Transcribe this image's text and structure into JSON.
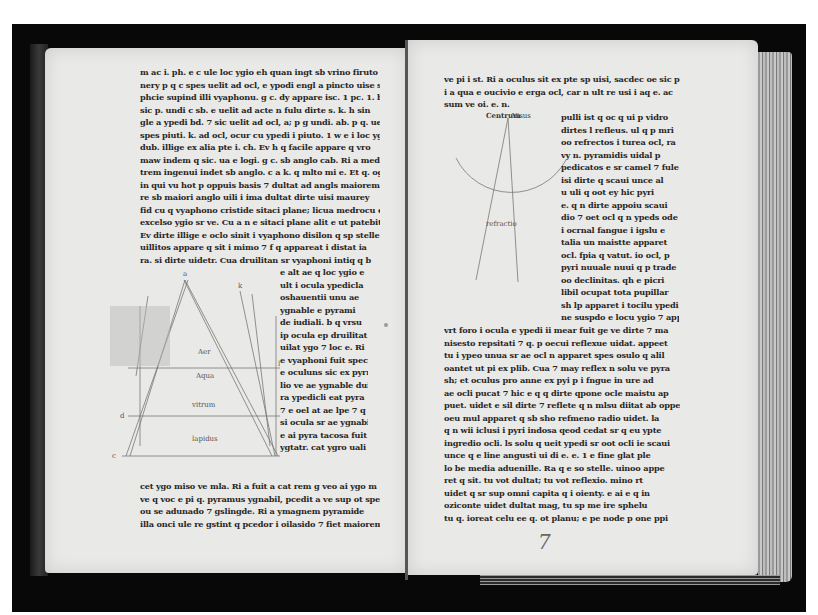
{
  "manuscript": {
    "description": "Open medieval manuscript, two-page spread on black background",
    "folio_number": "7",
    "left_page": {
      "text_top": [
        "m ac i. ph. e c ule loc ygio eh quan ingt sb vrino firuto i ocula",
        "nery p q c spes uelit ad ocl, e ypodi engl a pincto uise sr lu",
        "phcie supind illi vyaphonu. g c. dy appare isc. 1 pc. 1. b. q",
        "sic p. undi c sb. e uelit ad acte n fulu dirte s. k. h sin",
        "gle a ypedi bd. 7 sic uelit ad ocl, a; p g undi. ab. p q. uelit",
        "spes piuti. k. ad ocl, ocur cu ypedi i piuto. 1 w e i loc ygt",
        "dub. illige ex alia pte i. ch. Ev h q facile appare q vro",
        "maw indem q sic. ua e logi. g c. sb anglo cab. Ri a medi",
        "trem ingenui indet sb anglo. c a k. q mlto mi e. Et q. og",
        "in qui vu hot p oppuis basis 7 dultat ad angls maiorem",
        "re sb maiori anglo uili i ima dultat dirte uisi maurey",
        "fid cu q vyaphono cristide sitaci plane; licua medrocu e",
        "excelso ygio sr ve. Cu a n e sitaci plane alit e ut patebit.",
        "Ev dirte illige e oclo sinit i vyaphono disilon q sp stelle",
        "uillitos appare q sit i mimo 7 f q appareat i distat ia",
        "ra. si dirte uidetr. Cua druilitan sr vyaphoni intiq q b"
      ],
      "text_right_column": [
        "e alt ae q loc ygio e",
        "ult i ocula ypedicla",
        "oshauentii unu ae",
        "ygnable e pyrami",
        "de iudiali. b q vrsu",
        "ip ocula ep druilitat",
        "uilat ygo 7 loc e. Ri",
        "e vyaphoni fuit speci",
        "e oculuns sic ex pyrmi",
        "lio ve ae ygnable dui",
        "ra ypedicli eat pyra",
        "7 e oel at ae lpe 7 q",
        "si ocula sr ae ygnabi",
        "e ai pyra tacosa fuit",
        "ygtatr. cat ygro uali"
      ],
      "text_bottom": [
        "cet ygo miso ve mla. Ri a fuit a cat rem g veo ai ygo m",
        "ve q voc e pi q. pyramus ygnabil, pcedit a ve sup ot spe",
        "ou se adunado 7 gslingde. Ri a ymagnem pyramide",
        "illa onci ule re gstint q pcedor i oilasido 7 fiet maiorem."
      ],
      "diagram": {
        "type": "pyramid-refraction",
        "layer_labels": [
          "Aer",
          "Aqua",
          "vitrum",
          "lapidus"
        ],
        "point_labels": [
          "a",
          "b",
          "c",
          "d",
          "e",
          "f",
          "g",
          "h",
          "k",
          "l"
        ]
      }
    },
    "right_page": {
      "text_top": [
        "ve pi i st. Ri a oculus sit ex pte sp uisi, sacdec oe sic p",
        "i a qua e oucivio e erga ocl, car n ult re usi i aq e. ac",
        "sum ve oi. e. n."
      ],
      "text_right_column": [
        "pulli ist q oc q ui p vidro",
        "dirtes l refleus. ul q p mri",
        "oo refrectos i turea ocl, ra",
        "vy n. pyramidis uidal p",
        "pedicatos e sr camel 7 fule",
        "isi dirte q scaui unce al",
        "u uli q oot ey hic pyri",
        "e. q n dirte appoiu scaui",
        "dio 7 oet ocl q n ypeds ode",
        "i ocrnal fangue i igslu e",
        "talia un maistte apparet",
        "ocl. fpia q vatut. io ocl, p",
        "pyri nuuale nuui q p trade",
        "oo declinitas. qh e picri",
        "libil ocupat tota pupillar",
        "sh lp apparet i tocilu ypedi",
        "ne suspdo e locu ygio 7 app"
      ],
      "text_bottom": [
        "vrt foro i ocula e ypedi ii mear fuit ge ve dirte 7 ma",
        "nisesto repsitati 7 q. p oecui reflexue uidat. appeet",
        "tu i ypeo unua sr ae ocl n apparet spes osulo q alil",
        "oantet ut pi ex plib. Cua 7 may reflex n solu ve pyra",
        "sh; et oculus pro anne ex pyi p i fngue in ure ad",
        "ae ocli pucat 7 hic e q q dirte qpone ocle maistu ap",
        "puet. uidet e sil dirte 7 reflete q n mlsu diitat ab oppe",
        "oeu mul apparet q sb sho refmeno radio uidet. la",
        "q n wii iclusi i pyri indosa qeod cedat sr q eu ypte",
        "ingredio ocli. ls solu q ueit ypedi sr oot ocli ie scaui",
        "unce q e line angusti ui di e. e. 1 e fine glat ple",
        "lo be media aduenille. Ra q e so stelle. uinoo appe",
        "ret q sit. tu vot dultat; tu vot reflexio. mino rt",
        "uidet q sr sup omni capita q i oienty. e ai e q in",
        "oziconte uidet dultat mag, tu sp me ire sphelu",
        "tu q. ioreat celu ee q. ot planu; e pe node p one ppi"
      ],
      "diagram": {
        "type": "eye-circle-rays",
        "labels": [
          "Centrum",
          "Visus",
          "refractio"
        ]
      }
    }
  }
}
